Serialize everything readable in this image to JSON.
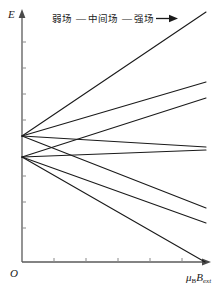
{
  "figure": {
    "name": "zeeman-energy-level-diagram",
    "background": "#ffffff",
    "line_color": "#1a1a1a",
    "axis_color": "#5a5a5a"
  },
  "annotation": {
    "weak_field": "弱场",
    "dash1": "—",
    "intermediate_field": "中间场",
    "dash2": "—",
    "strong_field": "强场",
    "arrow": "➤"
  },
  "axes": {
    "y_label": "E",
    "x_label_mu": "μ",
    "x_label_mu_sub": "B",
    "x_label_b": "B",
    "x_label_b_sub": "ext",
    "origin_label": "O"
  },
  "chart_data": {
    "type": "line",
    "xlabel": "μ_B B_ext",
    "ylabel": "E",
    "grid": false,
    "legend": null,
    "annotations": [
      "弱场 — 中间场 — 强场 →"
    ],
    "axis_ranges": {
      "x": [
        0,
        1
      ],
      "y": [
        0,
        1
      ]
    },
    "origin_px": {
      "x": 22,
      "y": 262
    },
    "nodes": [
      {
        "name": "upper-level",
        "x": 22,
        "y": 136
      },
      {
        "name": "lower-level",
        "x": 22,
        "y": 157
      }
    ],
    "series": [
      {
        "name": "upper-branch-1",
        "node": "upper-level",
        "points": [
          [
            22,
            136
          ],
          [
            206,
            12
          ]
        ]
      },
      {
        "name": "upper-branch-2",
        "node": "upper-level",
        "points": [
          [
            22,
            136
          ],
          [
            206,
            82
          ]
        ]
      },
      {
        "name": "upper-branch-3",
        "node": "upper-level",
        "points": [
          [
            22,
            136
          ],
          [
            206,
            147
          ]
        ]
      },
      {
        "name": "upper-branch-4",
        "node": "upper-level",
        "points": [
          [
            22,
            136
          ],
          [
            206,
            208
          ]
        ]
      },
      {
        "name": "lower-branch-1",
        "node": "lower-level",
        "points": [
          [
            22,
            157
          ],
          [
            206,
            98
          ]
        ]
      },
      {
        "name": "lower-branch-2",
        "node": "lower-level",
        "points": [
          [
            22,
            157
          ],
          [
            206,
            150
          ]
        ]
      },
      {
        "name": "lower-branch-3",
        "node": "lower-level",
        "points": [
          [
            22,
            157
          ],
          [
            206,
            223
          ]
        ]
      },
      {
        "name": "lower-branch-4",
        "node": "lower-level",
        "points": [
          [
            22,
            157
          ],
          [
            205,
            262
          ]
        ]
      }
    ],
    "x_ticks_px": [
      54,
      86,
      118,
      150,
      182
    ],
    "y_ticks_px": [
      42,
      68,
      94,
      120,
      176,
      202,
      228
    ]
  }
}
